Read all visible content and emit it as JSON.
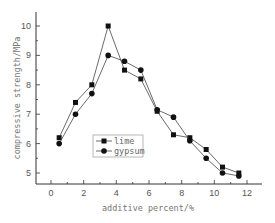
{
  "chart_data": {
    "type": "line",
    "title": "",
    "xlabel": "additive percent/%",
    "ylabel": "compressive strength/MPa",
    "xlim": [
      -1,
      13
    ],
    "ylim": [
      4.5,
      10.5
    ],
    "xticks": [
      0,
      2,
      4,
      6,
      8,
      10,
      12
    ],
    "yticks": [
      5,
      6,
      7,
      8,
      9,
      10
    ],
    "grid": false,
    "legend_position": "inside-lower-center",
    "x": [
      0.5,
      1.5,
      2.5,
      3.5,
      4.5,
      5.5,
      6.5,
      7.5,
      8.5,
      9.5,
      10.5,
      11.5
    ],
    "series": [
      {
        "name": "lime",
        "marker": "square",
        "values": [
          6.2,
          7.4,
          8.0,
          10.0,
          8.5,
          8.2,
          7.1,
          6.3,
          6.2,
          5.8,
          5.2,
          5.0
        ]
      },
      {
        "name": "gypsum",
        "marker": "circle",
        "values": [
          6.0,
          7.0,
          7.7,
          9.0,
          8.8,
          8.5,
          7.15,
          6.9,
          6.1,
          5.5,
          5.0,
          4.9
        ]
      }
    ]
  },
  "colors": {
    "line": "#444444",
    "marker": "#111111",
    "axis": "#333333"
  }
}
